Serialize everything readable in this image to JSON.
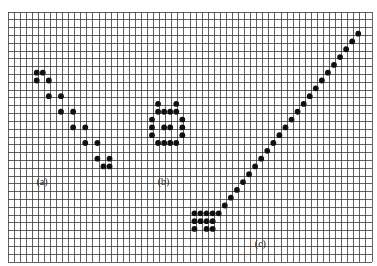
{
  "grid": {
    "columns": 60,
    "rows": 32,
    "line_color": "#3a3a3a",
    "dot_color": "#111111"
  },
  "patterns": [
    {
      "id": "a",
      "label": "(a)",
      "label_cell": [
        6,
        22
      ],
      "cells": [
        [
          5,
          8
        ],
        [
          6,
          8
        ],
        [
          5,
          9
        ],
        [
          7,
          9
        ],
        [
          7,
          11
        ],
        [
          9,
          11
        ],
        [
          9,
          13
        ],
        [
          11,
          13
        ],
        [
          11,
          15
        ],
        [
          13,
          15
        ],
        [
          13,
          17
        ],
        [
          15,
          17
        ],
        [
          15,
          19
        ],
        [
          17,
          19
        ],
        [
          16,
          20
        ],
        [
          17,
          20
        ]
      ]
    },
    {
      "id": "b",
      "label": "(b)",
      "label_cell": [
        26,
        22
      ],
      "cells": [
        [
          25,
          12
        ],
        [
          28,
          12
        ],
        [
          25,
          13
        ],
        [
          26,
          13
        ],
        [
          27,
          13
        ],
        [
          28,
          13
        ],
        [
          24,
          14
        ],
        [
          29,
          14
        ],
        [
          24,
          15
        ],
        [
          26,
          15
        ],
        [
          27,
          15
        ],
        [
          29,
          15
        ],
        [
          24,
          16
        ],
        [
          29,
          16
        ],
        [
          25,
          17
        ],
        [
          26,
          17
        ],
        [
          27,
          17
        ],
        [
          28,
          17
        ]
      ]
    },
    {
      "id": "c",
      "label": "(c)",
      "label_cell": [
        42,
        30
      ],
      "cells": [
        [
          31,
          26
        ],
        [
          32,
          26
        ],
        [
          33,
          26
        ],
        [
          34,
          26
        ],
        [
          35,
          26
        ],
        [
          31,
          27
        ],
        [
          32,
          27
        ],
        [
          33,
          27
        ],
        [
          34,
          27
        ],
        [
          31,
          28
        ],
        [
          33,
          28
        ],
        [
          34,
          28
        ],
        [
          36,
          25
        ],
        [
          37,
          24
        ],
        [
          38,
          23
        ],
        [
          39,
          22
        ],
        [
          40,
          21
        ],
        [
          41,
          20
        ],
        [
          42,
          19
        ],
        [
          43,
          18
        ],
        [
          44,
          17
        ],
        [
          45,
          16
        ],
        [
          46,
          15
        ],
        [
          47,
          14
        ],
        [
          48,
          13
        ],
        [
          49,
          12
        ],
        [
          50,
          11
        ],
        [
          51,
          10
        ],
        [
          52,
          9
        ],
        [
          53,
          8
        ],
        [
          54,
          7
        ],
        [
          55,
          6
        ],
        [
          56,
          5
        ],
        [
          57,
          4
        ],
        [
          58,
          3
        ]
      ]
    }
  ]
}
